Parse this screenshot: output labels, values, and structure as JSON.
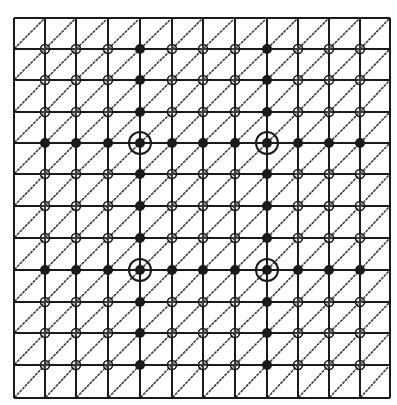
{
  "diagram": {
    "type": "lattice-grid",
    "grid": {
      "cols": 12,
      "rows": 12,
      "x_lines": [
        14,
        45,
        76,
        108,
        140,
        172,
        203,
        235,
        267,
        298,
        329,
        360,
        390
      ],
      "y_lines": [
        18,
        49,
        80,
        112,
        143,
        174,
        206,
        238,
        270,
        302,
        333,
        365,
        398
      ],
      "line_color": "#1a1a1a",
      "diagonal": "bottom-left-to-top-right",
      "diagonal_style": "dotted"
    },
    "legend_symbols": {
      "F": "filled-dot",
      "O": "open-circle",
      "R": "ringed-filled-dot"
    },
    "points": [
      "OOOFOOOFOOO",
      "OOOFOOOFOOO",
      "OOOFOOOFOOO",
      "FFFRFFFRFFF",
      "OOOFOOOFOOO",
      "OOOFOOOFOOO",
      "OOOFOOOFOOO",
      "FFFRFFFRFFF",
      "OOOFOOOFOOO",
      "OOOFOOOFOOO",
      "OOOFOOOFOOO"
    ],
    "ringed_points": [
      {
        "row": 4,
        "col": 4
      },
      {
        "row": 4,
        "col": 8
      },
      {
        "row": 8,
        "col": 4
      },
      {
        "row": 8,
        "col": 8
      }
    ],
    "colors": {
      "ink": "#1a1a1a",
      "background": "#ffffff"
    }
  }
}
